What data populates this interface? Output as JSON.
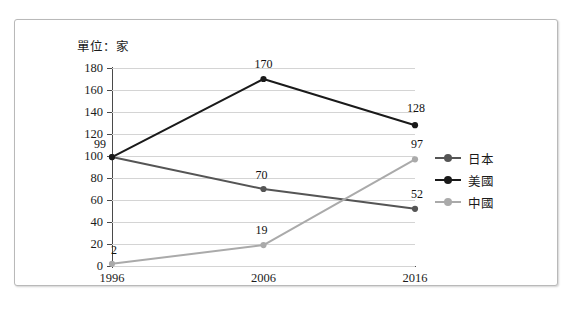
{
  "unit_note": "單位：家",
  "legend": {
    "items": [
      {
        "label": "日本",
        "color": "#555555"
      },
      {
        "label": "美國",
        "color": "#1a1a1a"
      },
      {
        "label": "中國",
        "color": "#aaaaaa"
      }
    ]
  },
  "axis": {
    "y_ticks": [
      "180",
      "160",
      "140",
      "120",
      "100",
      "80",
      "60",
      "40",
      "20",
      "0"
    ],
    "x_ticks": [
      "1996",
      "2006",
      "2016"
    ]
  },
  "chart_data": {
    "type": "line",
    "title": "",
    "subtitle": "",
    "xlabel": "",
    "ylabel": "",
    "unit": "單位：家",
    "categories": [
      "1996",
      "2006",
      "2016"
    ],
    "series": [
      {
        "name": "日本",
        "color": "#555555",
        "values": [
          99,
          70,
          52
        ]
      },
      {
        "name": "美國",
        "color": "#1a1a1a",
        "values": [
          99,
          170,
          128
        ]
      },
      {
        "name": "中國",
        "color": "#aaaaaa",
        "values": [
          2,
          19,
          97
        ]
      }
    ],
    "ylim": [
      0,
      180
    ],
    "ytick_step": 20,
    "grid": true,
    "grid_axis": "y",
    "legend_position": "right",
    "data_labels": true,
    "annotations": [
      {
        "series": "日本",
        "category": "1996",
        "value": 99,
        "text": "99"
      },
      {
        "series": "日本",
        "category": "2006",
        "value": 70,
        "text": "70"
      },
      {
        "series": "日本",
        "category": "2016",
        "value": 52,
        "text": "52"
      },
      {
        "series": "美國",
        "category": "2006",
        "value": 170,
        "text": "170"
      },
      {
        "series": "美國",
        "category": "2016",
        "value": 128,
        "text": "128"
      },
      {
        "series": "中國",
        "category": "1996",
        "value": 2,
        "text": "2"
      },
      {
        "series": "中國",
        "category": "2006",
        "value": 19,
        "text": "19"
      },
      {
        "series": "中國",
        "category": "2016",
        "value": 97,
        "text": "97"
      }
    ]
  }
}
